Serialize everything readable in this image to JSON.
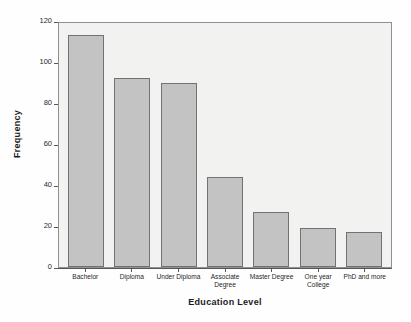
{
  "chart_data": {
    "type": "bar",
    "title": "",
    "xlabel": "Education Level",
    "ylabel": "Frequency",
    "categories": [
      "Bachelor",
      "Diploma",
      "Under Diploma",
      "Associate Degree",
      "Master Degree",
      "One year College",
      "PhD and more"
    ],
    "values": [
      113,
      92,
      90,
      44,
      27,
      19,
      17
    ],
    "ylim": [
      0,
      120
    ],
    "yticks": [
      0,
      20,
      40,
      60,
      80,
      100,
      120
    ],
    "ytick_labels": [
      "0",
      "20",
      "40",
      "60",
      "80",
      "100",
      "120"
    ],
    "grid": false,
    "legend": "none",
    "bar_color": "#c3c3c3",
    "bar_border_color": "#6f7376",
    "plot_background": "#f2f2f0",
    "figure_background": "#fefefe",
    "axis_color": "#55585a"
  },
  "axes": {
    "y_title": "Frequency",
    "x_title": "Education Level"
  }
}
